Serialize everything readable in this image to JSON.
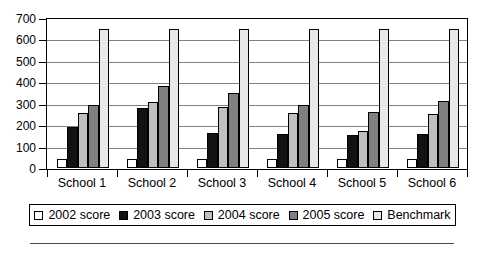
{
  "chart_data": {
    "type": "bar",
    "title": "",
    "xlabel": "",
    "ylabel": "",
    "ylim": [
      0,
      700
    ],
    "ytick_step": 100,
    "yticks": [
      0,
      100,
      200,
      300,
      400,
      500,
      600,
      700
    ],
    "ytick_labels": [
      "0",
      "100",
      "200",
      "300",
      "400",
      "500",
      "600",
      "700"
    ],
    "grid": true,
    "grid_axis": "y",
    "legend_position": "bottom",
    "categories": [
      "School 1",
      "School 2",
      "School 3",
      "School 4",
      "School 5",
      "School 6"
    ],
    "series": [
      {
        "name": "2002 score",
        "color": "#ffffff",
        "values": [
          40,
          40,
          40,
          40,
          40,
          40
        ]
      },
      {
        "name": "2003 score",
        "color": "#121212",
        "values": [
          190,
          280,
          165,
          160,
          155,
          160
        ]
      },
      {
        "name": "2004 score",
        "color": "#bfbfbf",
        "values": [
          255,
          310,
          285,
          255,
          175,
          250
        ]
      },
      {
        "name": "2005 score",
        "color": "#808080",
        "values": [
          293,
          385,
          350,
          292,
          262,
          315
        ]
      },
      {
        "name": "Benchmark",
        "color": "#e8e8e8",
        "values": [
          650,
          650,
          650,
          650,
          650,
          650
        ]
      }
    ]
  },
  "legend": {
    "items": [
      {
        "label": "2002 score",
        "color": "#ffffff"
      },
      {
        "label": "2003 score",
        "color": "#121212"
      },
      {
        "label": "2004 score",
        "color": "#bfbfbf"
      },
      {
        "label": "2005 score",
        "color": "#808080"
      },
      {
        "label": "Benchmark",
        "color": "#e8e8e8"
      }
    ]
  },
  "colors": {
    "axis": "#000000",
    "gridline": "#7f7f7f",
    "plot_background": "#ffffff",
    "page_background": "#ffffff",
    "rule": "#4d4d4d"
  }
}
